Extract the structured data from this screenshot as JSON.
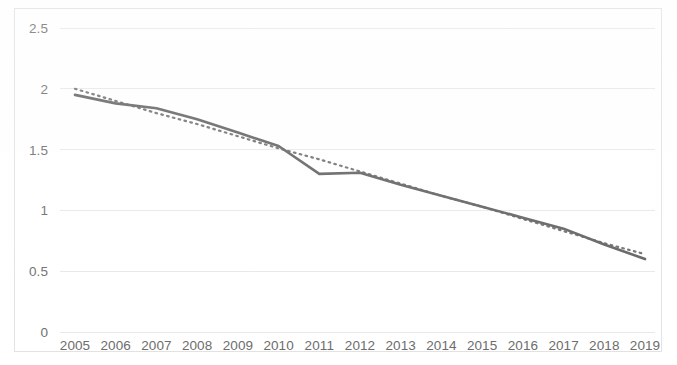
{
  "chart_data": {
    "type": "line",
    "title": "",
    "subtitle": "",
    "xlabel": "",
    "ylabel": "",
    "categories": [
      "2005",
      "2006",
      "2007",
      "2008",
      "2009",
      "2010",
      "2011",
      "2012",
      "2013",
      "2014",
      "2015",
      "2016",
      "2017",
      "2018",
      "2019"
    ],
    "x": [
      2005,
      2006,
      2007,
      2008,
      2009,
      2010,
      2011,
      2012,
      2013,
      2014,
      2015,
      2016,
      2017,
      2018,
      2019
    ],
    "xlim": [
      2005,
      2019
    ],
    "ylim": [
      0,
      2.5
    ],
    "y_ticks": [
      0,
      0.5,
      1,
      1.5,
      2,
      2.5
    ],
    "y_tick_labels": [
      "0",
      "0.5",
      "1",
      "1.5",
      "2",
      "2.5"
    ],
    "x_tick_labels": [
      "2005",
      "2006",
      "2007",
      "2008",
      "2009",
      "2010",
      "2011",
      "2012",
      "2013",
      "2014",
      "2015",
      "2016",
      "2017",
      "2018",
      "2019"
    ],
    "grid": true,
    "grid_axis": "y",
    "legend": false,
    "legend_position": "none",
    "series": [
      {
        "name": "value",
        "style": "solid",
        "color": "#5f5f5f",
        "values": [
          1.95,
          1.88,
          1.84,
          1.75,
          1.64,
          1.53,
          1.3,
          1.31,
          1.21,
          1.12,
          1.03,
          0.94,
          0.85,
          0.72,
          0.6
        ]
      },
      {
        "name": "trendline",
        "style": "dotted",
        "color": "#6e6e6e",
        "values": [
          2.0,
          1.9,
          1.8,
          1.71,
          1.61,
          1.51,
          1.42,
          1.32,
          1.22,
          1.12,
          1.03,
          0.93,
          0.83,
          0.73,
          0.64
        ]
      }
    ]
  },
  "axes": {
    "y_labels": [
      "2.5",
      "2",
      "1.5",
      "1",
      "0.5",
      "0"
    ],
    "x_labels": [
      "2005",
      "2006",
      "2007",
      "2008",
      "2009",
      "2010",
      "2011",
      "2012",
      "2013",
      "2014",
      "2015",
      "2016",
      "2017",
      "2018",
      "2019"
    ]
  },
  "colors": {
    "series_solid": "#5f5f5f",
    "series_trend": "#6e6e6e",
    "gridline": "#e8e8e8",
    "tick_text": "#6b6b6b",
    "frame": "#e2e2e2",
    "background": "#ffffff"
  }
}
